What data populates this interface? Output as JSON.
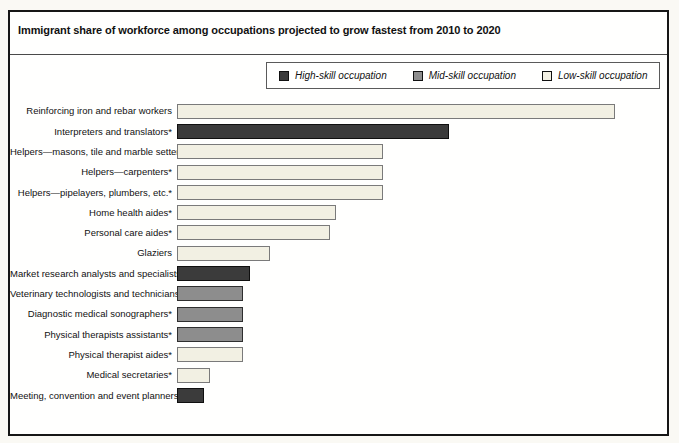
{
  "title": "Immigrant share of workforce among occupations projected to grow fastest from 2010 to 2020",
  "legend": [
    {
      "label": "High-skill occupation",
      "skill": "high"
    },
    {
      "label": "Mid-skill occupation",
      "skill": "mid"
    },
    {
      "label": "Low-skill occupation",
      "skill": "low"
    }
  ],
  "chart_data": {
    "type": "bar",
    "orientation": "horizontal",
    "title": "Immigrant share of workforce among occupations projected to grow fastest from 2010 to 2020",
    "xlabel": "",
    "ylabel": "",
    "xlim": [
      0,
      72
    ],
    "xticks": [
      "0%",
      "12%",
      "24%",
      "36%",
      "48%",
      "60%",
      "72%"
    ],
    "grid": false,
    "legend_position": "top-center",
    "colors": {
      "high": {
        "fill": "#3b3b3b",
        "border": "#0f0f0f"
      },
      "mid": {
        "fill": "#8d8d8d",
        "border": "#2e2e2e"
      },
      "low": {
        "fill": "#f2f0e3",
        "border": "#7a7a7a"
      }
    },
    "rows": [
      {
        "label": "Reinforcing iron and rebar workers",
        "value": 66,
        "skill": "low"
      },
      {
        "label": "Interpreters and translators*",
        "value": 41,
        "skill": "high"
      },
      {
        "label": "Helpers—masons, tile and marble setters*",
        "value": 31,
        "skill": "low"
      },
      {
        "label": "Helpers—carpenters*",
        "value": 31,
        "skill": "low"
      },
      {
        "label": "Helpers—pipelayers, plumbers, etc.*",
        "value": 31,
        "skill": "low"
      },
      {
        "label": "Home health aides*",
        "value": 24,
        "skill": "low"
      },
      {
        "label": "Personal care aides*",
        "value": 23,
        "skill": "low"
      },
      {
        "label": "Glaziers",
        "value": 14,
        "skill": "low"
      },
      {
        "label": "Market research analysts and specialists*",
        "value": 11,
        "skill": "high"
      },
      {
        "label": "Veterinary technologists and technicians*",
        "value": 10,
        "skill": "mid"
      },
      {
        "label": "Diagnostic medical sonographers*",
        "value": 10,
        "skill": "mid"
      },
      {
        "label": "Physical therapists assistants*",
        "value": 10,
        "skill": "mid"
      },
      {
        "label": "Physical therapist aides*",
        "value": 10,
        "skill": "low"
      },
      {
        "label": "Medical secretaries*",
        "value": 5,
        "skill": "low"
      },
      {
        "label": "Meeting, convention and event planners*",
        "value": 4,
        "skill": "high"
      }
    ]
  }
}
